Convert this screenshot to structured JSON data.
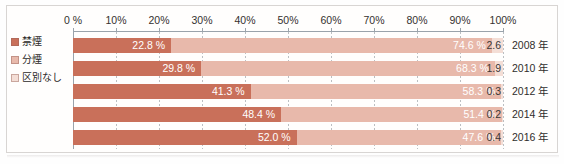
{
  "chart_data": {
    "type": "bar",
    "orientation": "horizontal",
    "stacked": true,
    "stacked_percent": true,
    "title": "",
    "xlabel": "",
    "ylabel": "",
    "xlim": [
      0,
      100
    ],
    "grid": true,
    "legend_position": "left",
    "categories": [
      "2008 年",
      "2010 年",
      "2012 年",
      "2014 年",
      "2016 年"
    ],
    "xticks": [
      0,
      10,
      20,
      30,
      40,
      50,
      60,
      70,
      80,
      90,
      100
    ],
    "xtick_labels": [
      "0 %",
      "10%",
      "20%",
      "30%",
      "40%",
      "50%",
      "60%",
      "70%",
      "80%",
      "90%",
      "100%"
    ],
    "series": [
      {
        "name": "禁煙",
        "color": "#c9705a",
        "values": [
          22.8,
          29.8,
          41.3,
          48.4,
          52.0
        ],
        "value_labels": [
          "22.8 %",
          "29.8 %",
          "41.3 %",
          "48.4 %",
          "52.0 %"
        ]
      },
      {
        "name": "分煙",
        "color": "#e8b9ab",
        "values": [
          74.6,
          68.3,
          58.3,
          51.4,
          47.6
        ],
        "value_labels": [
          "74.6 %",
          "68.3 %",
          "58.3 %",
          "51.4 %",
          "47.6 %"
        ]
      },
      {
        "name": "区別なし",
        "color": "#f4ded6",
        "values": [
          2.6,
          1.9,
          0.3,
          0.2,
          0.4
        ],
        "value_labels": [
          "2.6",
          "1.9",
          "0.3",
          "0.2",
          "0.4"
        ]
      }
    ]
  },
  "legend": {
    "items": [
      {
        "label": "禁煙",
        "color": "#c9705a"
      },
      {
        "label": "分煙",
        "color": "#e8b9ab"
      },
      {
        "label": "区別なし",
        "color": "#f4ded6"
      }
    ]
  },
  "axis": {
    "tick_labels": [
      "0 %",
      "10%",
      "20%",
      "30%",
      "40%",
      "50%",
      "60%",
      "70%",
      "80%",
      "90%",
      "100%"
    ]
  },
  "rows": [
    {
      "year": "2008 年",
      "a_label": "22.8 %",
      "b_label": "74.6 %",
      "c_label": "2.6",
      "a": 22.8,
      "b": 74.6,
      "c": 2.6
    },
    {
      "year": "2010 年",
      "a_label": "29.8 %",
      "b_label": "68.3 %",
      "c_label": "1.9",
      "a": 29.8,
      "b": 68.3,
      "c": 1.9
    },
    {
      "year": "2012 年",
      "a_label": "41.3 %",
      "b_label": "58.3 %",
      "c_label": "0.3",
      "a": 41.3,
      "b": 58.3,
      "c": 0.3
    },
    {
      "year": "2014 年",
      "a_label": "48.4 %",
      "b_label": "51.4 %",
      "c_label": "0.2",
      "a": 48.4,
      "b": 51.4,
      "c": 0.2
    },
    {
      "year": "2016 年",
      "a_label": "52.0 %",
      "b_label": "47.6 %",
      "c_label": "0.4",
      "a": 52.0,
      "b": 47.6,
      "c": 0.4
    }
  ]
}
